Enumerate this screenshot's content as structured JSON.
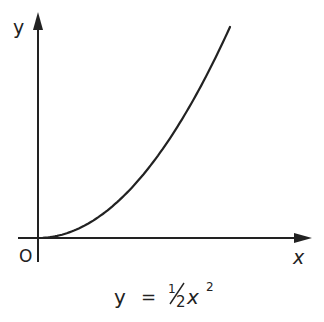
{
  "chart_data": {
    "type": "line",
    "title": "",
    "caption": "y = ½x²",
    "xlabel": "x",
    "ylabel": "y",
    "origin_label": "O",
    "grid": false,
    "legend": null,
    "series": [
      {
        "name": "y = ½x²",
        "x": [
          0,
          0.5,
          1,
          1.5,
          2,
          2.5,
          3,
          3.5,
          4
        ],
        "y": [
          0,
          0.125,
          0.5,
          1.125,
          2,
          3.125,
          4.5,
          6.125,
          8
        ]
      }
    ]
  },
  "labels": {
    "y_axis": "y",
    "x_axis": "x",
    "origin": "O",
    "equation_lhs": "y",
    "equation_eq": "=",
    "equation_frac_num": "1",
    "equation_frac_den": "2",
    "equation_var": "x",
    "equation_exp": "2"
  },
  "colors": {
    "ink": "#222222",
    "background": "#ffffff"
  }
}
